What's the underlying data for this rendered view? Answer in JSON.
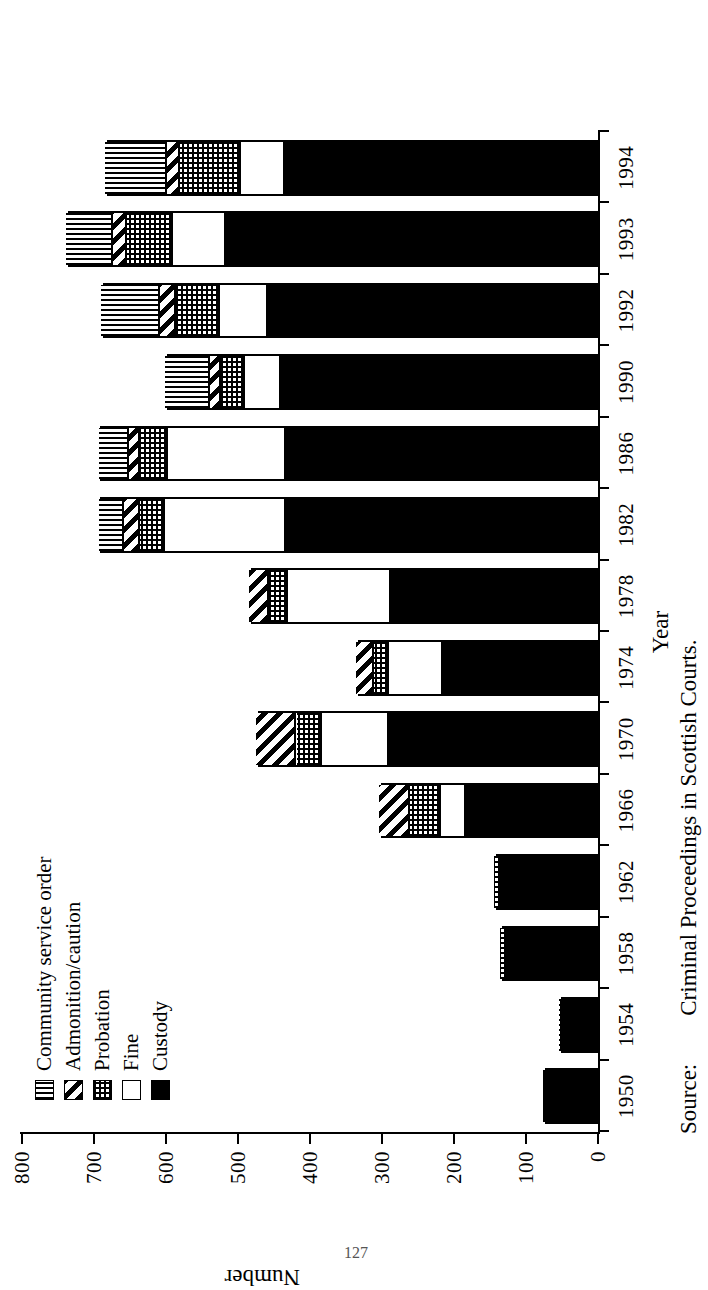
{
  "chart_data": {
    "type": "bar",
    "title": "",
    "subtitle": "",
    "orientation": "vertical-stacked",
    "stacked": true,
    "xlabel": "Year",
    "ylabel": "Number",
    "ylim": [
      0,
      800
    ],
    "ytick_step": 100,
    "yticks": [
      800,
      700,
      600,
      500,
      400,
      300,
      200,
      100,
      0
    ],
    "grid": false,
    "legend_position": "top-left-inside",
    "categories": [
      "1950",
      "1954",
      "1958",
      "1962",
      "1966",
      "1970",
      "1974",
      "1978",
      "1982",
      "1986",
      "1990",
      "1992",
      "1993",
      "1994"
    ],
    "series": [
      {
        "name": "Custody",
        "pattern": "solid-black",
        "values": [
          74,
          45,
          122,
          131,
          180,
          287,
          212,
          285,
          430,
          430,
          438,
          455,
          514,
          432
        ]
      },
      {
        "name": "Fine",
        "pattern": "white",
        "values": [
          0,
          0,
          0,
          0,
          35,
          94,
          75,
          143,
          169,
          165,
          50,
          67,
          74,
          61
        ]
      },
      {
        "name": "Probation",
        "pattern": "fine-dot-grid",
        "values": [
          0,
          6,
          11,
          11,
          43,
          35,
          22,
          26,
          35,
          39,
          33,
          61,
          64,
          85
        ]
      },
      {
        "name": "Admonition/caution",
        "pattern": "diagonal-stripes",
        "values": [
          0,
          0,
          0,
          0,
          43,
          56,
          24,
          28,
          21,
          14,
          15,
          22,
          19,
          18
        ]
      },
      {
        "name": "Community service order",
        "pattern": "wavy-vertical",
        "values": [
          0,
          0,
          0,
          0,
          0,
          0,
          0,
          0,
          36,
          43,
          63,
          83,
          65,
          86
        ]
      }
    ],
    "totals": [
      74,
      51,
      133,
      142,
      301,
      472,
      333,
      482,
      691,
      691,
      599,
      688,
      736,
      682
    ]
  },
  "legend": {
    "items": [
      {
        "label": "Community service order",
        "swatch": "wavy-vertical-swatch"
      },
      {
        "label": "Admonition/caution",
        "swatch": "diagonal-stripes-swatch"
      },
      {
        "label": "Probation",
        "swatch": "fine-dot-grid-swatch"
      },
      {
        "label": "Fine",
        "swatch": "white-swatch"
      },
      {
        "label": "Custody",
        "swatch": "solid-black-swatch"
      }
    ]
  },
  "axes": {
    "value_axis_title": "Number",
    "category_axis_title": "Year",
    "value_ticks": [
      "800",
      "700",
      "600",
      "500",
      "400",
      "300",
      "200",
      "100",
      "0"
    ],
    "category_ticks": [
      "1950",
      "1954",
      "1958",
      "1962",
      "1966",
      "1970",
      "1974",
      "1978",
      "1982",
      "1986",
      "1990",
      "1992",
      "1993",
      "1994"
    ]
  },
  "source": {
    "label": "Source:",
    "text": "Criminal Proceedings in Scottish Courts."
  },
  "page": {
    "folio": "127"
  }
}
